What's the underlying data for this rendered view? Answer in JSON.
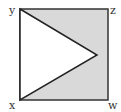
{
  "diagram": {
    "title": "",
    "labels": {
      "top_left": "y",
      "top_right": "z",
      "bottom_left": "x",
      "bottom_right": "w"
    },
    "shape": "square with triangle from vertices y and x to point on side zw; outside region shaded",
    "colors": {
      "shade": "#d9d9d9",
      "stroke": "#222222",
      "triangle_fill": "#ffffff"
    }
  }
}
